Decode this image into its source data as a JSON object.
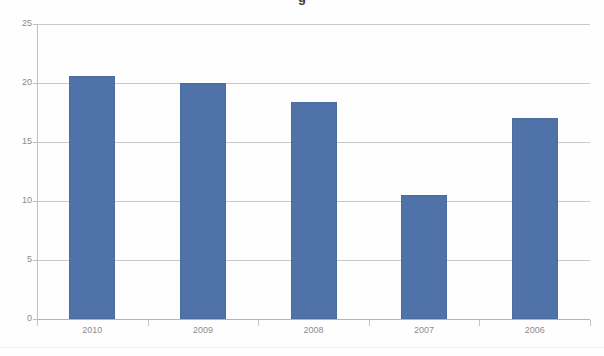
{
  "chart_data": {
    "type": "bar",
    "title": "",
    "subtitle": "",
    "xlabel": "",
    "ylabel": "",
    "categories": [
      "2010",
      "2009",
      "2008",
      "2007",
      "2006"
    ],
    "values": [
      20.6,
      20.0,
      18.4,
      10.5,
      17.0
    ],
    "series": [
      {
        "name": "",
        "values": [
          20.6,
          20.0,
          18.4,
          10.5,
          17.0
        ]
      }
    ],
    "ylim": [
      0,
      25
    ],
    "ytick_labels": [
      "0",
      "5",
      "10",
      "15",
      "20",
      "25"
    ],
    "ytick_values": [
      0,
      5,
      10,
      15,
      20,
      25
    ],
    "grid": true,
    "grid_axis": "y",
    "legend": false,
    "legend_position": "none",
    "bar_color": "#4f72a8",
    "bar_border_color": "#4a6c9f",
    "gridline_color": "#c8c8c8",
    "axis_color": "#c0c0c0",
    "tick_label_color": "#8a8a8a",
    "background_color": "#fefefe"
  },
  "axes": {
    "y": {
      "ticks": [
        {
          "label": "25",
          "value": 25
        },
        {
          "label": "20",
          "value": 20
        },
        {
          "label": "15",
          "value": 15
        },
        {
          "label": "10",
          "value": 10
        },
        {
          "label": "5",
          "value": 5
        },
        {
          "label": "0",
          "value": 0
        }
      ]
    },
    "x": {
      "ticks": [
        {
          "label": "2010"
        },
        {
          "label": "2009"
        },
        {
          "label": "2008"
        },
        {
          "label": "2007"
        },
        {
          "label": "2006"
        }
      ]
    }
  },
  "title_fragment": {
    "text": "g"
  }
}
